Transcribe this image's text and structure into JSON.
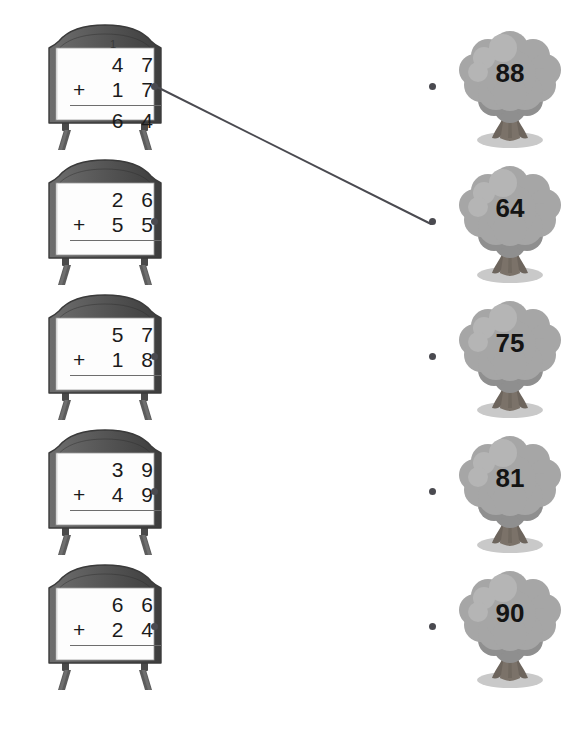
{
  "worksheet": {
    "type": "matching-activity",
    "instruction_text": "",
    "colors": {
      "board_frame_dark": "#4a4a4a",
      "board_frame_mid": "#6b6b6b",
      "board_face": "#fdfdfd",
      "tree_canopy": "#a6a6a6",
      "tree_canopy_shade": "#8f8f8f",
      "tree_trunk": "#7b7269",
      "tree_shadow": "#c9c9c9",
      "dot_color": "#4a4a50",
      "line_color": "#4a4a50",
      "digit_color": "#1b1b1b"
    }
  },
  "problems": [
    {
      "index": 1,
      "carry": "1",
      "addend_top": "4 7",
      "operator": "+",
      "addend_bottom": "1 7",
      "answer": "6 4",
      "has_answer": true,
      "dot_name": "problem-dot-1"
    },
    {
      "index": 2,
      "carry": "",
      "addend_top": "2 6",
      "operator": "+",
      "addend_bottom": "5 5",
      "answer": "",
      "has_answer": false,
      "dot_name": "problem-dot-2"
    },
    {
      "index": 3,
      "carry": "",
      "addend_top": "5 7",
      "operator": "+",
      "addend_bottom": "1 8",
      "answer": "",
      "has_answer": false,
      "dot_name": "problem-dot-3"
    },
    {
      "index": 4,
      "carry": "",
      "addend_top": "3 9",
      "operator": "+",
      "addend_bottom": "4 9",
      "answer": "",
      "has_answer": false,
      "dot_name": "problem-dot-4"
    },
    {
      "index": 5,
      "carry": "",
      "addend_top": "6 6",
      "operator": "+",
      "addend_bottom": "2 4",
      "answer": "",
      "has_answer": false,
      "dot_name": "problem-dot-5"
    }
  ],
  "answers": [
    {
      "index": 1,
      "value": "88",
      "dot_name": "answer-dot-1"
    },
    {
      "index": 2,
      "value": "64",
      "dot_name": "answer-dot-2"
    },
    {
      "index": 3,
      "value": "75",
      "dot_name": "answer-dot-3"
    },
    {
      "index": 4,
      "value": "81",
      "dot_name": "answer-dot-4"
    },
    {
      "index": 5,
      "value": "90",
      "dot_name": "answer-dot-5"
    }
  ],
  "connections": [
    {
      "from_problem": 1,
      "to_answer": 2,
      "x1": 155,
      "y1": 86,
      "x2": 431,
      "y2": 224
    }
  ],
  "row_tops": [
    20,
    155,
    290,
    425,
    560
  ]
}
